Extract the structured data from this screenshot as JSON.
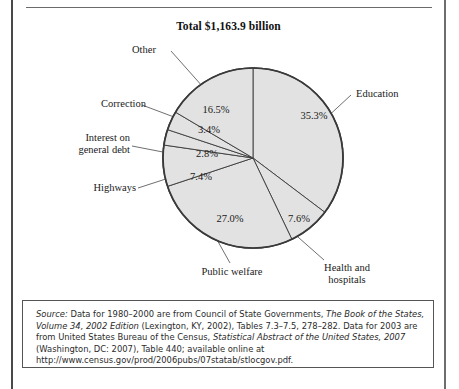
{
  "chart_data": {
    "type": "pie",
    "title": "Total $1,163.9 billion",
    "xlabel": "",
    "ylabel": "",
    "total_label": "Total $1,163.9 billion",
    "total_value": 1163.9,
    "units": "billion dollars",
    "legend_position": "callout-labels",
    "start_angle_deg": 0,
    "direction": "clockwise",
    "categories": [
      "Education",
      "Health and hospitals",
      "Public welfare",
      "Highways",
      "Interest on general debt",
      "Correction",
      "Other"
    ],
    "values": [
      35.3,
      7.6,
      27.0,
      7.4,
      2.8,
      3.4,
      16.5
    ],
    "value_labels": [
      "35.3%",
      "7.6%",
      "27.0%",
      "7.4%",
      "2.8%",
      "3.4%",
      "16.5%"
    ],
    "slices": [
      {
        "label": "Education",
        "value": 35.3,
        "value_label": "35.3%"
      },
      {
        "label": "Health and hospitals",
        "value": 7.6,
        "value_label": "7.6%"
      },
      {
        "label": "Public welfare",
        "value": 27.0,
        "value_label": "27.0%"
      },
      {
        "label": "Highways",
        "value": 7.4,
        "value_label": "7.4%"
      },
      {
        "label": "Interest on general debt",
        "value": 2.8,
        "value_label": "2.8%"
      },
      {
        "label": "Correction",
        "value": 3.4,
        "value_label": "3.4%"
      },
      {
        "label": "Other",
        "value": 16.5,
        "value_label": "16.5%"
      }
    ],
    "slice_fill_color": "#e2e2e2",
    "slice_stroke_color": "#3a3a3a",
    "grid": false
  },
  "labels": {
    "other": "Other",
    "correction": "Correction",
    "interest_line1": "Interest on",
    "interest_line2": "general debt",
    "highways": "Highways",
    "public_welfare": "Public welfare",
    "health_line1": "Health and",
    "health_line2": "hospitals",
    "education": "Education",
    "pct_other": "16.5%",
    "pct_correction": "3.4%",
    "pct_interest": "2.8%",
    "pct_highways": "7.4%",
    "pct_public_welfare": "27.0%",
    "pct_health": "7.6%",
    "pct_education": "35.3%"
  },
  "source": {
    "label": "Source:",
    "line1_a": " Data for 1980–2000 are from Council of State Governments, ",
    "line1_italic": "The Book of the States, Volume 34, 2002 Edition",
    "line1_b": " (Lexington, KY, 2002), Tables 7.3–7.5, 278–282. Data for 2003 are from United States Bureau of the Census, ",
    "line2_italic": "Statistical Abstract of the United States, 2007",
    "line2_b": " (Washington, DC: 2007), Table 440; available online at ",
    "url": "http://www.census.gov/prod/2006pubs/07statab/stlocgov.pdf."
  }
}
